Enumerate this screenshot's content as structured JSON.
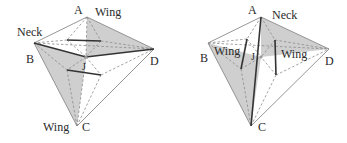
{
  "figures": [
    {
      "id": "left",
      "labels": {
        "A": "A",
        "B": "B",
        "C": "C",
        "D": "D",
        "J": "J",
        "tag_A": "Wing",
        "tag_B": "Neck",
        "tag_C": "Wing"
      }
    },
    {
      "id": "right",
      "labels": {
        "A": "A",
        "B": "B",
        "C": "C",
        "D": "D",
        "J": "J",
        "tag_A": "Neck",
        "tag_left": "Wing",
        "tag_right": "Wing"
      }
    }
  ],
  "colors": {
    "shade": "#cfcfcf",
    "edge": "#8a8a8a",
    "thick": "#333333",
    "text": "#2a2a2a"
  }
}
